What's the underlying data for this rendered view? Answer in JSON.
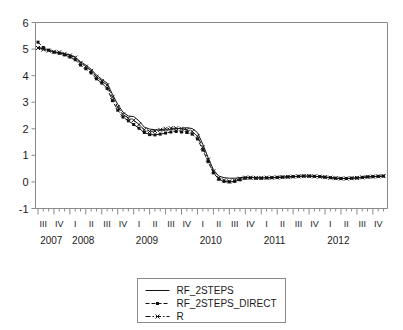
{
  "chart_data": {
    "type": "line",
    "title": "",
    "subtitle": "",
    "xlabel": "",
    "ylabel": "",
    "ylim": [
      -1,
      6
    ],
    "yticks": [
      -1,
      0,
      1,
      2,
      3,
      4,
      5,
      6
    ],
    "ytick_labels": [
      "-1",
      "0",
      "1",
      "2",
      "3",
      "4",
      "5",
      "6"
    ],
    "grid": false,
    "legend_position": "bottom-center",
    "x_axis": {
      "type": "quarterly-time",
      "frequency": "monthly-observations",
      "quarter_labels": [
        "III",
        "IV",
        "I",
        "II",
        "III",
        "IV",
        "I",
        "II",
        "III",
        "IV",
        "I",
        "II",
        "III",
        "IV",
        "I",
        "II",
        "III",
        "IV",
        "I",
        "II",
        "III",
        "IV"
      ],
      "year_labels": [
        "2007",
        "2008",
        "2009",
        "2010",
        "2011",
        "2012"
      ],
      "year_label_quarter_index": [
        0,
        2,
        6,
        10,
        14,
        18
      ],
      "start": "2007M07",
      "end": "2012M12",
      "n_points": 66
    },
    "series": [
      {
        "name": "RF_2STEPS",
        "style": "solid",
        "marker": "none",
        "color": "#111111",
        "values": [
          5.08,
          5.0,
          4.95,
          4.9,
          4.86,
          4.82,
          4.78,
          4.7,
          4.52,
          4.4,
          4.24,
          4.02,
          3.86,
          3.72,
          3.3,
          2.92,
          2.62,
          2.48,
          2.46,
          2.3,
          2.06,
          1.99,
          1.96,
          1.95,
          1.95,
          1.98,
          2.0,
          2.02,
          2.04,
          2.01,
          1.86,
          1.42,
          0.92,
          0.46,
          0.22,
          0.16,
          0.14,
          0.14,
          0.16,
          0.18,
          0.17,
          0.16,
          0.15,
          0.16,
          0.16,
          0.17,
          0.18,
          0.19,
          0.2,
          0.21,
          0.22,
          0.22,
          0.21,
          0.2,
          0.18,
          0.16,
          0.14,
          0.13,
          0.13,
          0.14,
          0.15,
          0.17,
          0.19,
          0.2,
          0.21,
          0.22
        ]
      },
      {
        "name": "RF_2STEPS_DIRECT",
        "style": "dashed",
        "marker": "square",
        "color": "#111111",
        "values": [
          5.26,
          5.06,
          4.96,
          4.88,
          4.84,
          4.78,
          4.7,
          4.6,
          4.4,
          4.26,
          4.1,
          3.88,
          3.72,
          3.52,
          3.06,
          2.7,
          2.44,
          2.3,
          2.16,
          2.02,
          1.86,
          1.78,
          1.77,
          1.8,
          1.84,
          1.88,
          1.9,
          1.88,
          1.86,
          1.8,
          1.62,
          1.2,
          0.76,
          0.34,
          0.1,
          0.02,
          0.0,
          0.02,
          0.08,
          0.14,
          0.15,
          0.14,
          0.14,
          0.15,
          0.16,
          0.17,
          0.18,
          0.19,
          0.2,
          0.21,
          0.22,
          0.22,
          0.21,
          0.2,
          0.18,
          0.16,
          0.14,
          0.13,
          0.13,
          0.14,
          0.15,
          0.17,
          0.19,
          0.2,
          0.21,
          0.22
        ]
      },
      {
        "name": "R",
        "style": "dash-dot",
        "marker": "cross",
        "color": "#111111",
        "values": [
          5.04,
          4.98,
          4.94,
          4.9,
          4.88,
          4.82,
          4.76,
          4.68,
          4.48,
          4.34,
          4.18,
          3.96,
          3.8,
          3.64,
          3.2,
          2.82,
          2.54,
          2.4,
          2.32,
          2.16,
          1.96,
          1.9,
          1.92,
          1.96,
          2.0,
          2.02,
          2.02,
          2.0,
          1.96,
          1.9,
          1.72,
          1.3,
          0.84,
          0.4,
          0.14,
          0.06,
          0.02,
          0.06,
          0.12,
          0.16,
          0.16,
          0.15,
          0.15,
          0.16,
          0.16,
          0.17,
          0.18,
          0.19,
          0.2,
          0.21,
          0.22,
          0.22,
          0.21,
          0.2,
          0.18,
          0.16,
          0.14,
          0.13,
          0.13,
          0.14,
          0.15,
          0.17,
          0.19,
          0.2,
          0.21,
          0.22
        ]
      }
    ],
    "legend": [
      {
        "label": "RF_2STEPS",
        "style": "solid",
        "marker": "none"
      },
      {
        "label": "RF_2STEPS_DIRECT",
        "style": "dashed",
        "marker": "square"
      },
      {
        "label": "R",
        "style": "dash-dot",
        "marker": "cross"
      }
    ]
  },
  "colors": {
    "axis": "#8a8a8a",
    "line": "#111111",
    "background": "#ffffff"
  }
}
